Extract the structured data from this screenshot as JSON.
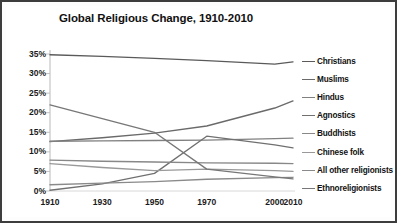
{
  "chart_data": {
    "type": "line",
    "title": "Global Religious Change, 1910-2010",
    "xlabel": "",
    "ylabel": "",
    "x": [
      1910,
      1930,
      1950,
      1970,
      2000,
      2010
    ],
    "xtick_labels": [
      "1910",
      "1930",
      "1950",
      "1970",
      "2000",
      "2010"
    ],
    "ytick_labels": [
      "0%",
      "5%",
      "10%",
      "15%",
      "20%",
      "25%",
      "30%",
      "35%"
    ],
    "ytick_values": [
      0,
      5,
      10,
      15,
      20,
      25,
      30,
      35
    ],
    "ylim": [
      0,
      35
    ],
    "grid": false,
    "legend_position": "right",
    "series": [
      {
        "name": "Christians",
        "color": "#5a5a5a",
        "values": [
          34.8,
          34.4,
          33.9,
          33.3,
          32.4,
          33.0
        ]
      },
      {
        "name": "Muslims",
        "color": "#6a6a6a",
        "values": [
          12.6,
          13.6,
          14.8,
          16.6,
          21.2,
          23.0
        ]
      },
      {
        "name": "Hindus",
        "color": "#808080",
        "values": [
          12.7,
          12.8,
          12.9,
          13.0,
          13.4,
          13.5
        ]
      },
      {
        "name": "Agnostics",
        "color": "#707070",
        "values": [
          0.2,
          1.8,
          4.5,
          14.0,
          11.8,
          11.0
        ]
      },
      {
        "name": "Buddhists",
        "color": "#888888",
        "values": [
          7.9,
          7.6,
          7.4,
          7.2,
          7.1,
          7.0
        ]
      },
      {
        "name": "Chinese folk",
        "color": "#999999",
        "values": [
          7.0,
          6.0,
          5.2,
          5.6,
          5.2,
          5.0
        ]
      },
      {
        "name": "All other religionists",
        "color": "#8a8a8a",
        "values": [
          1.6,
          2.0,
          2.4,
          3.0,
          3.4,
          3.5
        ]
      },
      {
        "name": "Ethnoreligionists",
        "color": "#777777",
        "values": [
          22.0,
          18.5,
          15.0,
          5.6,
          3.6,
          3.1
        ]
      }
    ]
  }
}
